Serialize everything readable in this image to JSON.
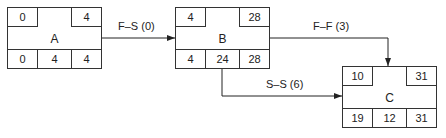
{
  "nodes": [
    {
      "id": "A",
      "name": "A",
      "top_left": "0",
      "top_right": "4",
      "bottom": [
        "0",
        "4",
        "4"
      ]
    },
    {
      "id": "B",
      "name": "B",
      "top_left": "4",
      "top_right": "28",
      "bottom": [
        "4",
        "24",
        "28"
      ]
    },
    {
      "id": "C",
      "name": "C",
      "top_left": "10",
      "top_right": "31",
      "bottom": [
        "19",
        "12",
        "31"
      ]
    }
  ],
  "links": [
    {
      "from": "A",
      "to": "B",
      "label": "F–S (0)"
    },
    {
      "from": "B",
      "to": "C",
      "label": "F–F (3)"
    },
    {
      "from": "B",
      "to": "C",
      "label": "S–S (6)"
    }
  ]
}
